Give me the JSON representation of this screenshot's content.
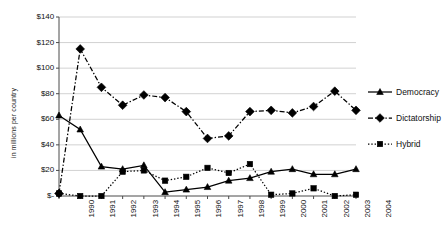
{
  "chart_data": {
    "type": "line",
    "title": "",
    "xlabel": "",
    "ylabel": "in millions per country",
    "ylim": [
      0,
      140
    ],
    "ytick_labels": [
      "$140",
      "$120",
      "$100",
      "$80",
      "$60",
      "$40",
      "$20",
      "$-"
    ],
    "ytick_values": [
      140,
      120,
      100,
      80,
      60,
      40,
      20,
      0
    ],
    "grid": "horizontal",
    "legend_position": "right",
    "categories": [
      "1990",
      "1991",
      "1992",
      "1993",
      "1994",
      "1995",
      "1996",
      "1997",
      "1998",
      "1999",
      "2000",
      "2001",
      "2002",
      "2003",
      "2004"
    ],
    "series": [
      {
        "name": "Democracy",
        "marker": "triangle",
        "line_style": "solid",
        "values": [
          63,
          52,
          23,
          21,
          24,
          3,
          5,
          7,
          12,
          14,
          19,
          21,
          17,
          17,
          21
        ]
      },
      {
        "name": "Dictatorship",
        "marker": "diamond",
        "line_style": "dash-dot",
        "values": [
          2,
          115,
          85,
          71,
          79,
          77,
          66,
          45,
          47,
          66,
          67,
          65,
          70,
          82,
          67
        ]
      },
      {
        "name": "Hybrid",
        "marker": "square",
        "line_style": "dotted",
        "values": [
          2,
          0,
          0,
          19,
          20,
          12,
          15,
          22,
          18,
          25,
          1,
          2,
          6,
          0,
          1
        ]
      }
    ]
  },
  "legend": {
    "items": [
      {
        "label": "Democracy"
      },
      {
        "label": "Dictatorship"
      },
      {
        "label": "Hybrid"
      }
    ]
  },
  "colors": {
    "series": "#000000",
    "grid": "#bdbdbd",
    "axis": "#4a4a4a",
    "text": "#111111",
    "background": "#ffffff"
  }
}
